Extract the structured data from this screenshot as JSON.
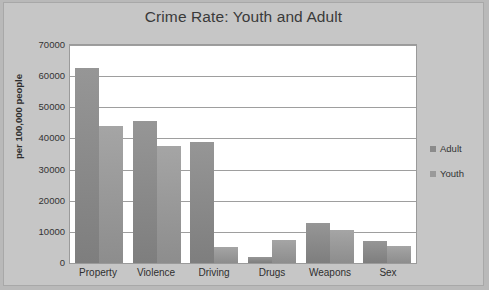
{
  "chart_data": {
    "type": "bar",
    "title": "Crime Rate: Youth and Adult",
    "xlabel": "",
    "ylabel": "per 100,000 people",
    "categories": [
      "Property",
      "Violence",
      "Driving",
      "Drugs",
      "Weapons",
      "Sex"
    ],
    "series": [
      {
        "name": "Adult",
        "color": "#8b8b8b",
        "values": [
          62500,
          45500,
          39000,
          2000,
          13000,
          7000
        ]
      },
      {
        "name": "Youth",
        "color": "#9a9a9a",
        "values": [
          44000,
          37500,
          5000,
          7500,
          10500,
          5500
        ]
      }
    ],
    "ylim": [
      0,
      70000
    ],
    "ytick_labels": [
      "70000",
      "60000",
      "50000",
      "40000",
      "30000",
      "20000",
      "10000",
      "0"
    ],
    "ytick_values": [
      70000,
      60000,
      50000,
      40000,
      30000,
      20000,
      10000,
      0
    ],
    "grid": "horizontal",
    "legend_position": "right",
    "legend": [
      "Adult",
      "Youth"
    ],
    "background_color": "#c6c6c6",
    "plot_background_color": "#ffffff",
    "gridline_color": "#9e9e9e",
    "title_color": "#3a3a3a"
  }
}
